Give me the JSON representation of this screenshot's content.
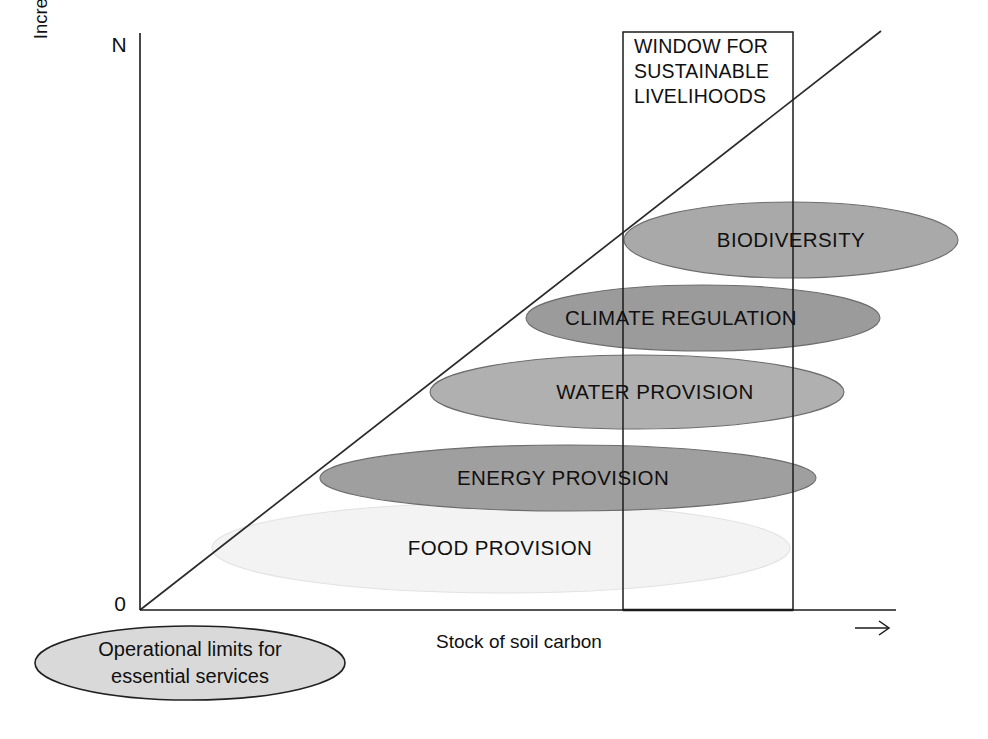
{
  "figure": {
    "background_color": "#ffffff",
    "axes": {
      "y_axis_title": "Increasing numbers (and bundles) of ecosystem goods and services",
      "y_axis_top_label": "N",
      "y_axis_bottom_label": "0",
      "x_axis_title": "Stock of soil carbon",
      "x_axis_arrow": "rightwards-arrow"
    },
    "window_box": {
      "label_line_1": "WINDOW FOR",
      "label_line_2": "SUSTAINABLE",
      "label_line_3": "LIVELIHOODS"
    },
    "legend": {
      "label_line_1": "Operational limits for",
      "label_line_2": "essential services",
      "fill_color": "#d9d9d9"
    },
    "diagonal_line_color": "#2a2a2a"
  },
  "chart_data": {
    "type": "diagram",
    "title": "",
    "xlabel": "Stock of soil carbon",
    "ylabel": "Increasing numbers (and bundles) of ecosystem goods and services",
    "xlim": [
      "0",
      "increasing"
    ],
    "ylim": [
      "0",
      "N"
    ],
    "grid": false,
    "legend_position": "below-left",
    "annotations": [
      "WINDOW FOR SUSTAINABLE LIVELIHOODS",
      "Operational limits for essential services"
    ],
    "items": [
      {
        "label": "BIODIVERSITY",
        "fill": "#a9a9a9",
        "cx": 791,
        "cy": 240,
        "rx": 167,
        "ry": 38,
        "label_x": 791,
        "label_y": 240
      },
      {
        "label": "CLIMATE REGULATION",
        "fill": "#9b9b9b",
        "cx": 703,
        "cy": 318,
        "rx": 177,
        "ry": 33,
        "label_x": 681,
        "label_y": 318
      },
      {
        "label": "WATER PROVISION",
        "fill": "#b0b0b0",
        "cx": 637,
        "cy": 392,
        "rx": 207,
        "ry": 37,
        "label_x": 655,
        "label_y": 392
      },
      {
        "label": "ENERGY PROVISION",
        "fill": "#9f9f9f",
        "cx": 568,
        "cy": 478,
        "rx": 248,
        "ry": 33,
        "label_x": 563,
        "label_y": 478
      },
      {
        "label": "FOOD PROVISION",
        "fill": "#f3f3f3",
        "cx": 501,
        "cy": 548,
        "rx": 289,
        "ry": 45,
        "label_x": 500,
        "label_y": 548
      }
    ]
  }
}
